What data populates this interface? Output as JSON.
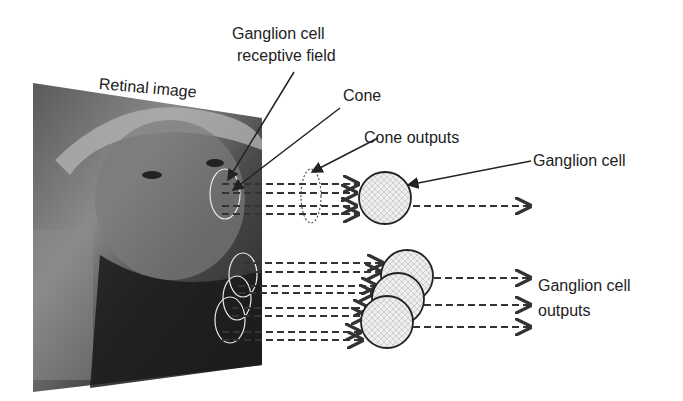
{
  "diagram": {
    "labels": {
      "retinal_image": "Retinal image",
      "receptive_field_line1": "Ganglion cell",
      "receptive_field_line2": "receptive field",
      "cone": "Cone",
      "cone_outputs": "Cone outputs",
      "ganglion_cell": "Ganglion cell",
      "outputs_line1": "Ganglion cell",
      "outputs_line2": "outputs"
    },
    "colors": {
      "text": "#222222",
      "arrow": "#333333",
      "cell_fill": "#e6e6e6",
      "cell_stroke": "#222222"
    }
  }
}
